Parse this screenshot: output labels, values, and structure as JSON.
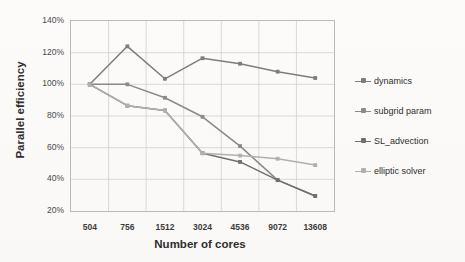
{
  "chart_data": {
    "type": "line",
    "title": "",
    "xlabel": "Number of cores",
    "ylabel": "Parallel efficiency",
    "categories": [
      "504",
      "756",
      "1512",
      "3024",
      "4536",
      "9072",
      "13608"
    ],
    "ylim": [
      20,
      140
    ],
    "yticks": [
      "20%",
      "40%",
      "60%",
      "80%",
      "100%",
      "120%",
      "140%"
    ],
    "ytick_values": [
      20,
      40,
      60,
      80,
      100,
      120,
      140
    ],
    "grid": true,
    "legend_position": "right",
    "series": [
      {
        "name": "dynamics",
        "color": "#7d7d7d",
        "values": [
          100,
          124,
          103.5,
          116.5,
          113,
          108,
          104
        ]
      },
      {
        "name": "subgrid param",
        "color": "#8a8a8a",
        "values": [
          100,
          100,
          91.5,
          79.5,
          61,
          39.5,
          29.5
        ]
      },
      {
        "name": "SL_advection",
        "color": "#6f6f6f",
        "values": [
          100,
          86.5,
          83.5,
          56.5,
          51,
          39.5,
          29.5
        ]
      },
      {
        "name": "elliptic solver",
        "color": "#b0b0b0",
        "values": [
          100,
          86.5,
          83.5,
          56.5,
          55,
          53,
          49
        ]
      }
    ]
  },
  "legend": {
    "items": [
      {
        "label": "dynamics"
      },
      {
        "label": "subgrid param"
      },
      {
        "label": "SL_advection"
      },
      {
        "label": "elliptic solver"
      }
    ]
  }
}
